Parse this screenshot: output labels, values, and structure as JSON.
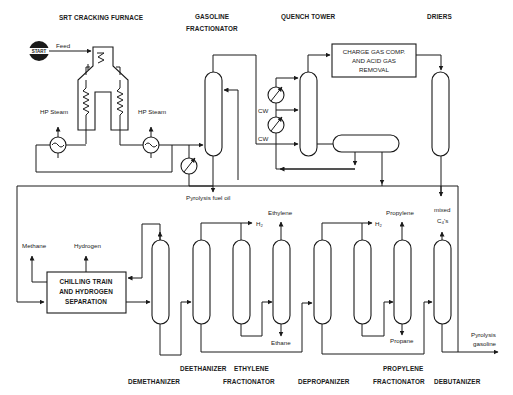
{
  "diagram": {
    "section_labels": {
      "furnace": "SRT CRACKING FURNACE",
      "gasoline_frac_1": "GASOLINE",
      "gasoline_frac_2": "FRACTIONATOR",
      "quench": "QUENCH TOWER",
      "driers": "DRIERS"
    },
    "start_badge": "START",
    "streams": {
      "feed": "Feed",
      "hp_steam_left": "HP Steam",
      "hp_steam_right": "HP Steam",
      "cw_top": "CW",
      "cw_bottom": "CW",
      "pyrolysis_fuel_oil": "Pyrolysis fuel oil",
      "methane": "Methane",
      "hydrogen": "Hydrogen",
      "h2_deethanizer": "H₂",
      "ethylene": "Ethylene",
      "ethane": "Ethane",
      "h2_depropanizer": "H₂",
      "propylene": "Propylene",
      "propane": "Propane",
      "mixed_c4_1": "mixed",
      "mixed_c4_2": "C₄'s",
      "pyrolysis_gasoline_1": "Pyrolysis",
      "pyrolysis_gasoline_2": "gasoline"
    },
    "boxes": {
      "charge_gas_1": "CHARGE GAS COMP.",
      "charge_gas_2": "AND ACID GAS",
      "charge_gas_3": "REMOVAL",
      "chilling_1": "CHILLING TRAIN",
      "chilling_2": "AND HYDROGEN",
      "chilling_3": "SEPARATION"
    },
    "columns_bottom": {
      "demethanizer": "DEMETHANIZER",
      "deethanizer": "DEETHANIZER",
      "ethylene_frac_1": "ETHYLENE",
      "ethylene_frac_2": "FRACTIONATOR",
      "depropanizer": "DEPROPANIZER",
      "propylene_frac_1": "PROPYLENE",
      "propylene_frac_2": "FRACTIONATOR",
      "debutanizer": "DEBUTANIZER"
    }
  }
}
